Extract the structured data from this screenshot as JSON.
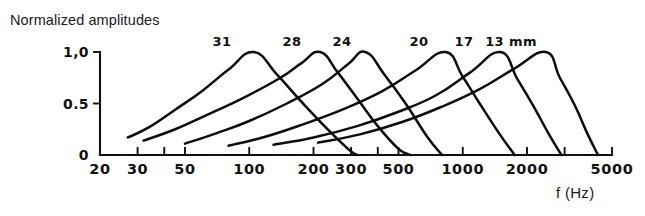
{
  "figure": {
    "title": "Normalized amplitudes",
    "x_axis_caption": "f (Hz)"
  },
  "chart_data": {
    "type": "line",
    "title": "Normalized amplitudes",
    "xlabel": "f (Hz)",
    "ylabel": "Normalized amplitudes",
    "xscale": "log",
    "xlim": [
      20,
      5000
    ],
    "ylim": [
      0,
      1.05
    ],
    "grid": false,
    "legend": "inline-labels-above-peaks",
    "y_ticks": [
      {
        "value": 0,
        "label": "0"
      },
      {
        "value": 0.5,
        "label": "0.5"
      },
      {
        "value": 1.0,
        "label": "1,0"
      }
    ],
    "x_ticks": [
      {
        "value": 20,
        "label": "20",
        "labelled": true
      },
      {
        "value": 30,
        "label": "30",
        "labelled": true
      },
      {
        "value": 40,
        "label": "",
        "labelled": false
      },
      {
        "value": 50,
        "label": "50",
        "labelled": true
      },
      {
        "value": 100,
        "label": "100",
        "labelled": true
      },
      {
        "value": 200,
        "label": "200",
        "labelled": true
      },
      {
        "value": 300,
        "label": "300",
        "labelled": true
      },
      {
        "value": 400,
        "label": "",
        "labelled": false
      },
      {
        "value": 500,
        "label": "500",
        "labelled": true
      },
      {
        "value": 1000,
        "label": "1000",
        "labelled": true
      },
      {
        "value": 2000,
        "label": "2000",
        "labelled": true
      },
      {
        "value": 3000,
        "label": "",
        "labelled": false
      },
      {
        "value": 5000,
        "label": "5000",
        "labelled": true
      }
    ],
    "series": [
      {
        "name": "31",
        "label": "31",
        "label_suffix": "",
        "peak_frequency": 105,
        "peak_amplitude": 1.0,
        "start_frequency": 27,
        "start_amplitude": 0.17,
        "end_frequency": 320,
        "points": [
          [
            27,
            0.17
          ],
          [
            34,
            0.27
          ],
          [
            45,
            0.44
          ],
          [
            60,
            0.62
          ],
          [
            80,
            0.83
          ],
          [
            105,
            1.0
          ],
          [
            135,
            0.78
          ],
          [
            175,
            0.52
          ],
          [
            230,
            0.26
          ],
          [
            290,
            0.06
          ],
          [
            320,
            0.0
          ]
        ]
      },
      {
        "name": "28",
        "label": "28",
        "label_suffix": "",
        "peak_frequency": 215,
        "peak_amplitude": 1.0,
        "start_frequency": 32,
        "start_amplitude": 0.14,
        "end_frequency": 570,
        "points": [
          [
            32,
            0.14
          ],
          [
            45,
            0.25
          ],
          [
            65,
            0.4
          ],
          [
            95,
            0.56
          ],
          [
            140,
            0.75
          ],
          [
            175,
            0.89
          ],
          [
            215,
            1.0
          ],
          [
            260,
            0.8
          ],
          [
            320,
            0.55
          ],
          [
            400,
            0.28
          ],
          [
            500,
            0.06
          ],
          [
            570,
            0.0
          ]
        ]
      },
      {
        "name": "24",
        "label": "24",
        "label_suffix": "",
        "peak_frequency": 350,
        "peak_amplitude": 1.0,
        "start_frequency": 50,
        "start_amplitude": 0.11,
        "end_frequency": 800,
        "points": [
          [
            50,
            0.11
          ],
          [
            70,
            0.21
          ],
          [
            100,
            0.33
          ],
          [
            150,
            0.5
          ],
          [
            220,
            0.69
          ],
          [
            290,
            0.88
          ],
          [
            350,
            1.0
          ],
          [
            430,
            0.78
          ],
          [
            540,
            0.5
          ],
          [
            680,
            0.18
          ],
          [
            800,
            0.0
          ]
        ]
      },
      {
        "name": "20",
        "label": "20",
        "label_suffix": "",
        "peak_frequency": 830,
        "peak_amplitude": 1.0,
        "start_frequency": 80,
        "start_amplitude": 0.09,
        "end_frequency": 1750,
        "points": [
          [
            80,
            0.09
          ],
          [
            120,
            0.18
          ],
          [
            180,
            0.3
          ],
          [
            280,
            0.45
          ],
          [
            420,
            0.62
          ],
          [
            600,
            0.82
          ],
          [
            830,
            1.0
          ],
          [
            1000,
            0.76
          ],
          [
            1200,
            0.5
          ],
          [
            1480,
            0.21
          ],
          [
            1750,
            0.0
          ]
        ]
      },
      {
        "name": "17",
        "label": "17",
        "label_suffix": "",
        "peak_frequency": 1500,
        "peak_amplitude": 1.0,
        "start_frequency": 130,
        "start_amplitude": 0.1,
        "end_frequency": 2900,
        "points": [
          [
            130,
            0.1
          ],
          [
            200,
            0.17
          ],
          [
            320,
            0.28
          ],
          [
            500,
            0.42
          ],
          [
            750,
            0.58
          ],
          [
            1080,
            0.8
          ],
          [
            1500,
            1.0
          ],
          [
            1800,
            0.74
          ],
          [
            2150,
            0.47
          ],
          [
            2550,
            0.19
          ],
          [
            2900,
            0.0
          ]
        ]
      },
      {
        "name": "13 mm",
        "label": "13",
        "label_suffix": "mm",
        "peak_frequency": 2450,
        "peak_amplitude": 1.0,
        "start_frequency": 210,
        "start_amplitude": 0.12,
        "end_frequency": 4300,
        "points": [
          [
            210,
            0.12
          ],
          [
            330,
            0.2
          ],
          [
            520,
            0.32
          ],
          [
            800,
            0.47
          ],
          [
            1200,
            0.64
          ],
          [
            1750,
            0.84
          ],
          [
            2450,
            1.0
          ],
          [
            2850,
            0.75
          ],
          [
            3350,
            0.48
          ],
          [
            3850,
            0.2
          ],
          [
            4300,
            0.0
          ]
        ]
      }
    ],
    "curve_labels": [
      {
        "text": "31",
        "x_pixel": 222,
        "y_pixel": 46
      },
      {
        "text": "28",
        "x_pixel": 292,
        "y_pixel": 46
      },
      {
        "text": "24",
        "x_pixel": 342,
        "y_pixel": 46
      },
      {
        "text": "20",
        "x_pixel": 419,
        "y_pixel": 46
      },
      {
        "text": "17",
        "x_pixel": 464,
        "y_pixel": 46
      },
      {
        "text": "13 mm",
        "x_pixel": 511,
        "y_pixel": 46
      }
    ]
  }
}
